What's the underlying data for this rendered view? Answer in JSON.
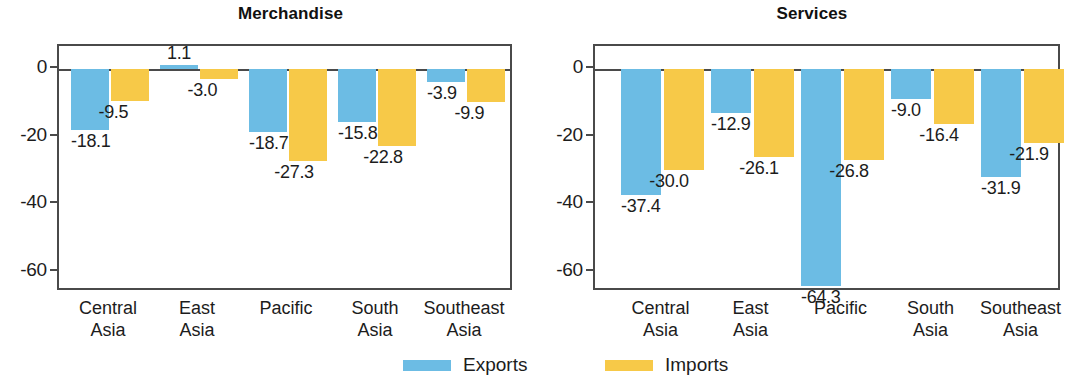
{
  "legend": {
    "entries": [
      {
        "label": "Exports",
        "color": "#6CBCE4",
        "key": "exports"
      },
      {
        "label": "Imports",
        "color": "#F7C948",
        "key": "imports"
      }
    ]
  },
  "axis": {
    "ticks": [
      "0",
      "-20",
      "-40",
      "-60"
    ],
    "tick_values": [
      0,
      -20,
      -40,
      -60
    ]
  },
  "categories": [
    {
      "line1": "Central",
      "line2": "Asia"
    },
    {
      "line1": "East",
      "line2": "Asia"
    },
    {
      "line1": "Pacific",
      "line2": ""
    },
    {
      "line1": "South",
      "line2": "Asia"
    },
    {
      "line1": "Southeast",
      "line2": "Asia"
    }
  ],
  "chart_data": [
    {
      "type": "bar",
      "title": "Merchandise",
      "xlabel": "",
      "ylabel": "",
      "ylim": [
        -70,
        5
      ],
      "grid": false,
      "legend_position": "bottom",
      "categories": [
        "Central Asia",
        "East Asia",
        "Pacific",
        "South Asia",
        "Southeast Asia"
      ],
      "series": [
        {
          "name": "Exports",
          "color": "#6CBCE4",
          "values": [
            -18.1,
            1.1,
            -18.7,
            -15.8,
            -3.9
          ],
          "labels": [
            "-18.1",
            "1.1",
            "-18.7",
            "-15.8",
            "-3.9"
          ]
        },
        {
          "name": "Imports",
          "color": "#F7C948",
          "values": [
            -9.5,
            -3.0,
            -27.3,
            -22.8,
            -9.9
          ],
          "labels": [
            "-9.5",
            "-3.0",
            "-27.3",
            "-22.8",
            "-9.9"
          ]
        }
      ]
    },
    {
      "type": "bar",
      "title": "Services",
      "xlabel": "",
      "ylabel": "",
      "ylim": [
        -70,
        5
      ],
      "grid": false,
      "legend_position": "bottom",
      "categories": [
        "Central Asia",
        "East Asia",
        "Pacific",
        "South Asia",
        "Southeast Asia"
      ],
      "series": [
        {
          "name": "Exports",
          "color": "#6CBCE4",
          "values": [
            -37.4,
            -12.9,
            -64.3,
            -9.0,
            -31.9
          ],
          "labels": [
            "-37.4",
            "-12.9",
            "-64.3",
            "-9.0",
            "-31.9"
          ]
        },
        {
          "name": "Imports",
          "color": "#F7C948",
          "values": [
            -30.0,
            -26.1,
            -26.8,
            -16.4,
            -21.9
          ],
          "labels": [
            "-30.0",
            "-26.1",
            "-26.8",
            "-16.4",
            "-21.9"
          ]
        }
      ]
    }
  ]
}
